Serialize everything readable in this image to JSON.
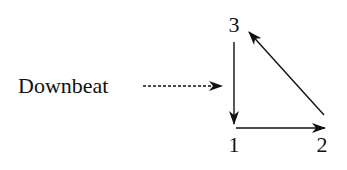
{
  "diagram": {
    "label": "Downbeat",
    "beats": [
      {
        "number": "1",
        "x": 234,
        "y": 152
      },
      {
        "number": "2",
        "x": 322,
        "y": 152
      },
      {
        "number": "3",
        "x": 234,
        "y": 26
      }
    ],
    "arrows": [
      {
        "from": "3",
        "to": "1",
        "style": "solid"
      },
      {
        "from": "1",
        "to": "2",
        "style": "solid"
      },
      {
        "from": "2",
        "to": "3",
        "style": "solid"
      },
      {
        "from": "Downbeat",
        "to": "1",
        "style": "dashed"
      }
    ],
    "colors": {
      "ink": "#111111",
      "background": "#ffffff"
    }
  }
}
